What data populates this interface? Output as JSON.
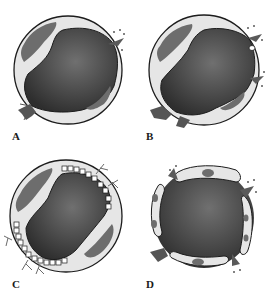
{
  "figure": {
    "panels": [
      {
        "id": "A",
        "label": "A",
        "description": "Intact vessel wall with two endothelial cells; blood escaping through gap at upper-right and lower-left"
      },
      {
        "id": "B",
        "label": "B",
        "description": "Vessel with irregular/damaged endothelial border on right; multiple escape points"
      },
      {
        "id": "C",
        "label": "C",
        "description": "Vessel wall with fenestrated/segmented endothelium along upper-right and lower-left edges"
      },
      {
        "id": "D",
        "label": "D",
        "description": "Vessel lined by separate elongated cells with nuclei; gaps between cells with leakage"
      }
    ]
  },
  "colors": {
    "lumen_dark": "#3a3a3a",
    "lumen_mid": "#6a6a6a",
    "wall_light": "#e4e4e4",
    "nucleus": "#6d6d6d",
    "outline": "#1c1c1c",
    "background": "#ffffff"
  }
}
